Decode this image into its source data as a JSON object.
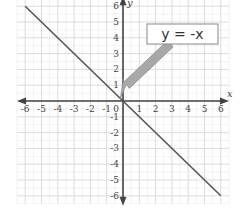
{
  "chart_data": {
    "type": "line",
    "title": "",
    "xlabel": "x",
    "ylabel": "y",
    "xlim": [
      -6,
      6
    ],
    "ylim": [
      -6,
      6
    ],
    "grid": true,
    "x_ticks": [
      -6,
      -5,
      -4,
      -3,
      -2,
      -1,
      1,
      2,
      3,
      4,
      5,
      6
    ],
    "y_ticks": [
      6,
      5,
      4,
      3,
      2,
      1,
      -1,
      -2,
      -3,
      -4,
      -5,
      -6
    ],
    "origin_label": "0",
    "series": [
      {
        "name": "y = -x",
        "x": [
          -6,
          6
        ],
        "y": [
          6,
          -6
        ],
        "color": "#555555"
      }
    ],
    "annotations": [
      {
        "text": "y = -x",
        "box_position": "upper-right",
        "arrow_points_to": [
          -0.1,
          0.1
        ],
        "arrow_color": "#9a9a9a"
      }
    ],
    "legend": null
  },
  "colors": {
    "grid": "#d9d9d9",
    "axis": "#444444",
    "line": "#555555",
    "arrow_fill": "#a8a8a8",
    "box_border": "#888888"
  }
}
